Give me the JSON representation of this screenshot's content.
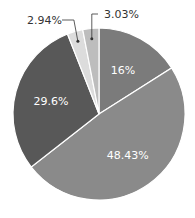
{
  "chart_data": {
    "type": "pie",
    "title": "",
    "start_angle_deg": 0,
    "direction": "clockwise",
    "slices": [
      {
        "label": "16%",
        "value": 16.0,
        "color": "#7b7b7b",
        "label_pos": "inside"
      },
      {
        "label": "48.43%",
        "value": 48.43,
        "color": "#8a8a8a",
        "label_pos": "inside"
      },
      {
        "label": "29.6%",
        "value": 29.6,
        "color": "#585858",
        "label_pos": "inside"
      },
      {
        "label": "2.94%",
        "value": 2.94,
        "color": "#dcdcdc",
        "label_pos": "outside"
      },
      {
        "label": "3.03%",
        "value": 3.03,
        "color": "#bdbdbd",
        "label_pos": "outside"
      }
    ],
    "legend": "none"
  },
  "geometry": {
    "cx": 99,
    "cy": 114,
    "r": 86
  }
}
